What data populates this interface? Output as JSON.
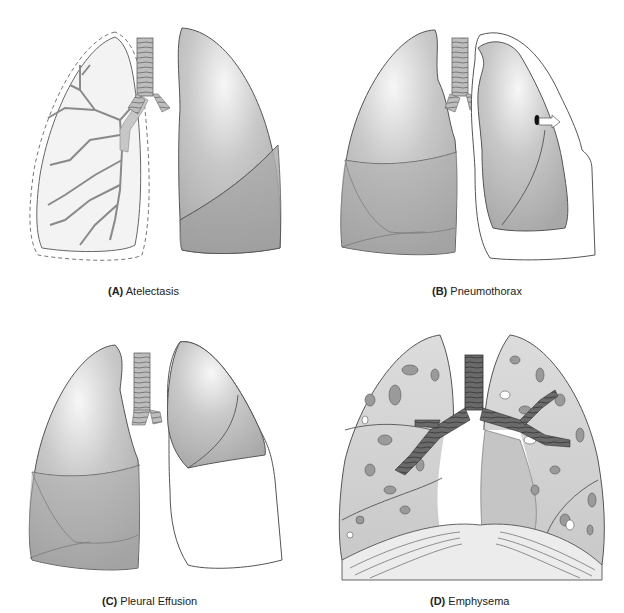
{
  "figure": {
    "panels": [
      {
        "id": "A",
        "letter": "(A)",
        "label": "Atelectasis"
      },
      {
        "id": "B",
        "letter": "(B)",
        "label": "Pneumothorax"
      },
      {
        "id": "C",
        "letter": "(C)",
        "label": "Pleural Effusion"
      },
      {
        "id": "D",
        "letter": "(D)",
        "label": "Emphysema"
      }
    ],
    "colors": {
      "lung_light": "#d9d9d9",
      "lung_mid": "#b4b4b4",
      "lung_dark": "#a3a3a3",
      "outline": "#555555",
      "bronchi": "#9a9a9a",
      "trachea_dark": "#6e6e6e",
      "background": "#ffffff"
    }
  }
}
